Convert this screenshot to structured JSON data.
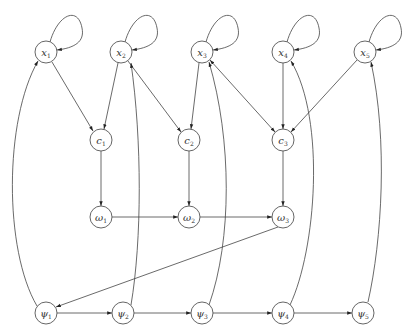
{
  "diagram": {
    "type": "directed-graph",
    "node_radius": 11,
    "colors": {
      "stroke": "#444444",
      "node_fill": "#ffffff",
      "text": "#333333"
    },
    "nodes": [
      {
        "id": "x1",
        "symbol": "x",
        "sub": "1",
        "cx": 46,
        "cy": 52
      },
      {
        "id": "x2",
        "symbol": "x",
        "sub": "2",
        "cx": 121,
        "cy": 52
      },
      {
        "id": "x3",
        "symbol": "x",
        "sub": "3",
        "cx": 202,
        "cy": 52
      },
      {
        "id": "x4",
        "symbol": "x",
        "sub": "4",
        "cx": 283,
        "cy": 52
      },
      {
        "id": "x5",
        "symbol": "x",
        "sub": "5",
        "cx": 365,
        "cy": 52
      },
      {
        "id": "c1",
        "symbol": "c",
        "sub": "1",
        "cx": 101,
        "cy": 140
      },
      {
        "id": "c2",
        "symbol": "c",
        "sub": "2",
        "cx": 189,
        "cy": 140
      },
      {
        "id": "c3",
        "symbol": "c",
        "sub": "3",
        "cx": 283,
        "cy": 140
      },
      {
        "id": "w1",
        "symbol": "ω",
        "sub": "1",
        "cx": 101,
        "cy": 217
      },
      {
        "id": "w2",
        "symbol": "ω",
        "sub": "2",
        "cx": 189,
        "cy": 217
      },
      {
        "id": "w3",
        "symbol": "ω",
        "sub": "3",
        "cx": 283,
        "cy": 217
      },
      {
        "id": "p1",
        "symbol": "ψ",
        "sub": "1",
        "cx": 46,
        "cy": 313
      },
      {
        "id": "p2",
        "symbol": "ψ",
        "sub": "2",
        "cx": 123,
        "cy": 313
      },
      {
        "id": "p3",
        "symbol": "ψ",
        "sub": "3",
        "cx": 202,
        "cy": 313
      },
      {
        "id": "p4",
        "symbol": "ψ",
        "sub": "4",
        "cx": 283,
        "cy": 313
      },
      {
        "id": "p5",
        "symbol": "ψ",
        "sub": "5",
        "cx": 363,
        "cy": 313
      }
    ],
    "edges": [
      {
        "id": "x1-self",
        "from": "x1",
        "to": "x1",
        "kind": "self-loop"
      },
      {
        "id": "x2-self",
        "from": "x2",
        "to": "x2",
        "kind": "self-loop"
      },
      {
        "id": "x3-self",
        "from": "x3",
        "to": "x3",
        "kind": "self-loop"
      },
      {
        "id": "x4-self",
        "from": "x4",
        "to": "x4",
        "kind": "self-loop"
      },
      {
        "id": "x5-self",
        "from": "x5",
        "to": "x5",
        "kind": "self-loop"
      },
      {
        "id": "x1-c1",
        "from": "x1",
        "to": "c1",
        "kind": "straight"
      },
      {
        "id": "x2-c1",
        "from": "x2",
        "to": "c1",
        "kind": "straight"
      },
      {
        "id": "x2-c2",
        "from": "x2",
        "to": "c2",
        "kind": "straight"
      },
      {
        "id": "x3-c2",
        "from": "x3",
        "to": "c2",
        "kind": "straight"
      },
      {
        "id": "x3-c3",
        "from": "x3",
        "to": "c3",
        "kind": "straight",
        "bidirectional": true
      },
      {
        "id": "x4-c3",
        "from": "x4",
        "to": "c3",
        "kind": "straight"
      },
      {
        "id": "x5-c3",
        "from": "x5",
        "to": "c3",
        "kind": "straight"
      },
      {
        "id": "c1-w1",
        "from": "c1",
        "to": "w1",
        "kind": "straight"
      },
      {
        "id": "c2-w2",
        "from": "c2",
        "to": "w2",
        "kind": "straight"
      },
      {
        "id": "c3-w3",
        "from": "c3",
        "to": "w3",
        "kind": "straight"
      },
      {
        "id": "w1-w2",
        "from": "w1",
        "to": "w2",
        "kind": "straight"
      },
      {
        "id": "w2-w3",
        "from": "w2",
        "to": "w3",
        "kind": "straight"
      },
      {
        "id": "w3-p1",
        "from": "w3",
        "to": "p1",
        "kind": "straight"
      },
      {
        "id": "p1-p2",
        "from": "p1",
        "to": "p2",
        "kind": "straight"
      },
      {
        "id": "p2-p3",
        "from": "p2",
        "to": "p3",
        "kind": "straight"
      },
      {
        "id": "p3-p4",
        "from": "p3",
        "to": "p4",
        "kind": "straight"
      },
      {
        "id": "p4-p5",
        "from": "p4",
        "to": "p5",
        "kind": "straight"
      },
      {
        "id": "p1-x1",
        "from": "p1",
        "to": "x1",
        "kind": "curved"
      },
      {
        "id": "p2-x2",
        "from": "p2",
        "to": "x2",
        "kind": "curved"
      },
      {
        "id": "p3-x3",
        "from": "p3",
        "to": "x3",
        "kind": "curved"
      },
      {
        "id": "p4-x4",
        "from": "p4",
        "to": "x4",
        "kind": "curved"
      },
      {
        "id": "p5-x5",
        "from": "p5",
        "to": "x5",
        "kind": "curved"
      }
    ]
  }
}
